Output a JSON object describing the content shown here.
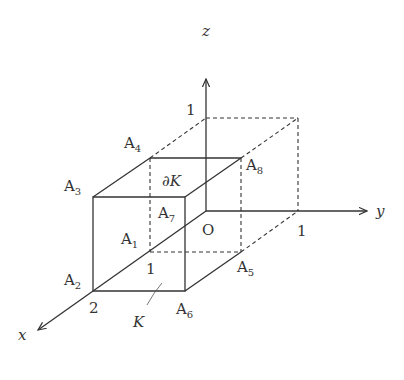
{
  "figure": {
    "type": "3d-rectangular-box"
  },
  "colors": {
    "ink": "#333333",
    "background": "#ffffff"
  },
  "axes": {
    "x": {
      "label": "x",
      "tick_label": "2"
    },
    "y": {
      "label": "y",
      "tick_label": "1"
    },
    "z": {
      "label": "z",
      "tick_label": "1"
    },
    "origin": {
      "label": "O"
    }
  },
  "box_tick": {
    "label": "1"
  },
  "vertices": {
    "A1": {
      "base": "A",
      "sub": "1"
    },
    "A2": {
      "base": "A",
      "sub": "2"
    },
    "A3": {
      "base": "A",
      "sub": "3"
    },
    "A4": {
      "base": "A",
      "sub": "4"
    },
    "A5": {
      "base": "A",
      "sub": "5"
    },
    "A6": {
      "base": "A",
      "sub": "6"
    },
    "A7": {
      "base": "A",
      "sub": "7"
    },
    "A8": {
      "base": "A",
      "sub": "8"
    }
  },
  "region": {
    "label": "K"
  },
  "boundary": {
    "partial": "∂",
    "label": "K"
  }
}
